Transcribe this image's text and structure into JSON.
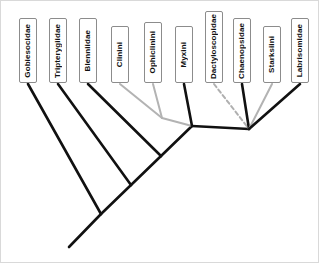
{
  "figure": {
    "kind": "cladogram",
    "title": "",
    "background_color": "#ffffff",
    "frame_color": "#d9d9d9",
    "branch_color_solid_black": "#111111",
    "branch_color_solid_gray": "#b3b3b3",
    "branch_color_dashed_gray": "#b0b0b0"
  },
  "taxa": [
    {
      "id": "gobiesocidae",
      "label": "Gobiesocidae",
      "box": {
        "x": 18,
        "y": 17,
        "w": 18,
        "h": 65
      },
      "tip": {
        "x": 27,
        "y": 83
      },
      "branch_style": "solid",
      "branch_color": "#111111",
      "node": "n1"
    },
    {
      "id": "tripterygiidae",
      "label": "Tripterygiidae",
      "box": {
        "x": 48,
        "y": 17,
        "w": 18,
        "h": 65
      },
      "tip": {
        "x": 57,
        "y": 83
      },
      "branch_style": "solid",
      "branch_color": "#111111",
      "node": "n2"
    },
    {
      "id": "blenniidae",
      "label": "Blenniidae",
      "box": {
        "x": 78,
        "y": 17,
        "w": 18,
        "h": 65
      },
      "tip": {
        "x": 87,
        "y": 83
      },
      "branch_style": "solid",
      "branch_color": "#111111",
      "node": "n3"
    },
    {
      "id": "clinini",
      "label": "Clinini",
      "box": {
        "x": 110,
        "y": 25,
        "w": 18,
        "h": 57
      },
      "tip": {
        "x": 119,
        "y": 83
      },
      "branch_style": "solid",
      "branch_color": "#b3b3b3",
      "node": "n5"
    },
    {
      "id": "ophiclinini",
      "label": "Ophiclinini",
      "box": {
        "x": 143,
        "y": 21,
        "w": 18,
        "h": 61
      },
      "tip": {
        "x": 152,
        "y": 83
      },
      "branch_style": "solid",
      "branch_color": "#b3b3b3",
      "node": "n5"
    },
    {
      "id": "myxini",
      "label": "Myxini",
      "box": {
        "x": 174,
        "y": 25,
        "w": 18,
        "h": 57
      },
      "tip": {
        "x": 183,
        "y": 83
      },
      "branch_style": "solid",
      "branch_color": "#111111",
      "node": "n4"
    },
    {
      "id": "dactyloscopidae",
      "label": "Dactyloscopidae",
      "box": {
        "x": 204,
        "y": 10,
        "w": 18,
        "h": 72
      },
      "tip": {
        "x": 213,
        "y": 83
      },
      "branch_style": "dashed",
      "branch_color": "#b0b0b0",
      "node": "n6"
    },
    {
      "id": "chaenopsidae",
      "label": "Chaenopsidae",
      "box": {
        "x": 232,
        "y": 17,
        "w": 18,
        "h": 65
      },
      "tip": {
        "x": 241,
        "y": 83
      },
      "branch_style": "solid",
      "branch_color": "#111111",
      "node": "n6"
    },
    {
      "id": "starksiini",
      "label": "Starksiini",
      "box": {
        "x": 262,
        "y": 25,
        "w": 18,
        "h": 57
      },
      "tip": {
        "x": 271,
        "y": 83
      },
      "branch_style": "solid",
      "branch_color": "#b3b3b3",
      "node": "n6"
    },
    {
      "id": "labrisomidae",
      "label": "Labrisomidae",
      "box": {
        "x": 290,
        "y": 17,
        "w": 18,
        "h": 65
      },
      "tip": {
        "x": 299,
        "y": 83
      },
      "branch_style": "solid",
      "branch_color": "#111111",
      "node": "n6"
    }
  ],
  "nodes": [
    {
      "id": "n1",
      "x": 100,
      "y": 213
    },
    {
      "id": "n2",
      "x": 130,
      "y": 184
    },
    {
      "id": "n3",
      "x": 160,
      "y": 155
    },
    {
      "id": "n4",
      "x": 191,
      "y": 125
    },
    {
      "id": "n5",
      "x": 161,
      "y": 117
    },
    {
      "id": "n6",
      "x": 248,
      "y": 128
    },
    {
      "id": "root",
      "x": 68,
      "y": 246
    }
  ],
  "internal_branches": [
    {
      "from": "root",
      "to": "n1",
      "style": "solid",
      "color": "#111111"
    },
    {
      "from": "n1",
      "to": "n2",
      "style": "solid",
      "color": "#111111"
    },
    {
      "from": "n2",
      "to": "n3",
      "style": "solid",
      "color": "#111111"
    },
    {
      "from": "n3",
      "to": "n4",
      "style": "solid",
      "color": "#111111"
    },
    {
      "from": "n4",
      "to": "n5",
      "style": "solid",
      "color": "#b3b3b3"
    },
    {
      "from": "n4",
      "to": "n6",
      "style": "solid",
      "color": "#111111"
    }
  ]
}
